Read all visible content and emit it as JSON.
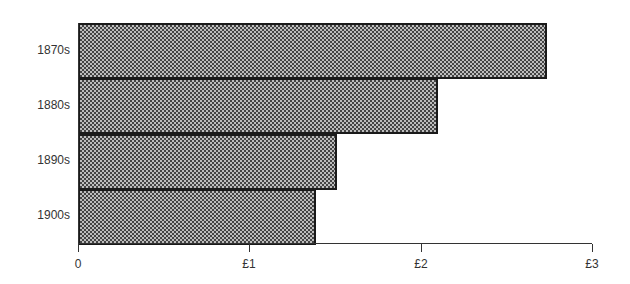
{
  "chart_data": {
    "type": "bar",
    "orientation": "horizontal",
    "title": "",
    "xlabel": "",
    "ylabel": "",
    "categories": [
      "1870s",
      "1880s",
      "1890s",
      "1900s"
    ],
    "values": [
      2.74,
      2.1,
      1.51,
      1.39
    ],
    "xlim": [
      0,
      3
    ],
    "x_ticks": [
      "0",
      "£1",
      "£2",
      "£3"
    ],
    "x_tick_values": [
      0,
      1,
      2,
      3
    ],
    "grid": false,
    "legend": null,
    "bar_style": "checkered dot pattern, black outline"
  }
}
